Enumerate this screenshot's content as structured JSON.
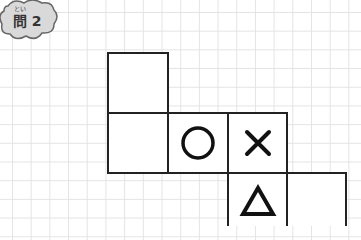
{
  "badge": {
    "furigana": "とい",
    "label": "問 2"
  },
  "net_cells": [
    {
      "row": 1,
      "col": 1,
      "symbol": ""
    },
    {
      "row": 2,
      "col": 1,
      "symbol": ""
    },
    {
      "row": 2,
      "col": 2,
      "symbol": "circle"
    },
    {
      "row": 2,
      "col": 3,
      "symbol": "cross"
    },
    {
      "row": 3,
      "col": 3,
      "symbol": "triangle"
    },
    {
      "row": 3,
      "col": 4,
      "symbol": ""
    }
  ],
  "colors": {
    "badge_fill": "#d9d9d9",
    "badge_border": "#666666",
    "line": "#222222",
    "grid": "#e4e4e4"
  }
}
